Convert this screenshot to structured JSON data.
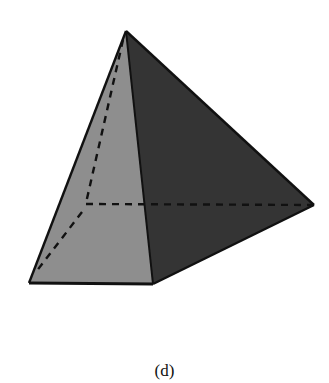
{
  "figure": {
    "kind": "square-pyramid",
    "caption": "(d)",
    "vertices": {
      "apex": [
        126,
        31
      ],
      "base_front_left": [
        29,
        283
      ],
      "base_front_right": [
        153,
        284
      ],
      "base_back_right": [
        314,
        205
      ],
      "base_back_left_hidden": [
        85,
        204
      ]
    },
    "faces": {
      "left_face_color": "#8e8e8e",
      "right_face_color": "#343434"
    },
    "edge_color": "#111111",
    "hidden_edge_style": "dashed"
  }
}
